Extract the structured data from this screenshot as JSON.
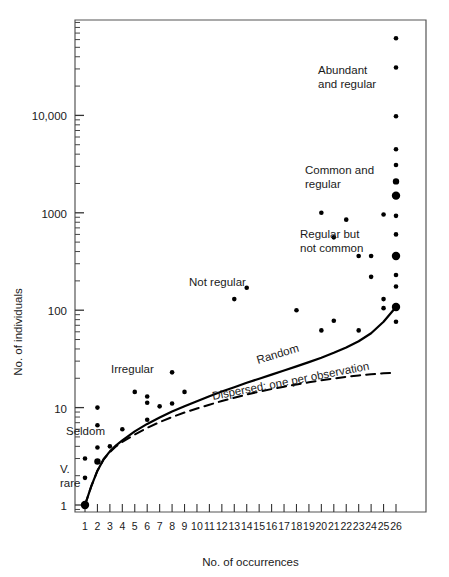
{
  "chart_data": {
    "type": "scatter",
    "title": "",
    "xlabel": "No. of occurrences",
    "ylabel": "No. of individuals",
    "xscale": "linear",
    "yscale": "log",
    "xlim": [
      0.2,
      26.9
    ],
    "ylim": [
      0.62,
      70000
    ],
    "grid": false,
    "legend": "none",
    "xticks": [
      1,
      2,
      3,
      4,
      5,
      6,
      7,
      8,
      9,
      10,
      11,
      12,
      13,
      14,
      15,
      16,
      17,
      18,
      19,
      20,
      21,
      22,
      23,
      24,
      25,
      26
    ],
    "xticklabels": [
      "1",
      "2",
      "3",
      "4",
      "5",
      "6",
      "7",
      "8",
      "9",
      "10",
      "11",
      "12",
      "13",
      "14",
      "15",
      "16",
      "17",
      "18",
      "19",
      "20",
      "21",
      "22",
      "23",
      "24",
      "25",
      "26"
    ],
    "yticks": [
      1,
      10,
      100,
      1000,
      10000
    ],
    "yticklabels": [
      "1",
      "10",
      "100",
      "1000",
      "10,000"
    ],
    "y_minor_ticks": true,
    "series": [
      {
        "name": "observations",
        "marker": "filled-circle",
        "color": "#000000",
        "points": [
          {
            "x": 1,
            "y": 1,
            "size": "large"
          },
          {
            "x": 1,
            "y": 1.9,
            "size": "small"
          },
          {
            "x": 1,
            "y": 3.0,
            "size": "small"
          },
          {
            "x": 2,
            "y": 2.8,
            "size": "medium"
          },
          {
            "x": 2,
            "y": 3.9,
            "size": "small"
          },
          {
            "x": 2,
            "y": 6.6,
            "size": "small"
          },
          {
            "x": 2,
            "y": 10.0,
            "size": "small"
          },
          {
            "x": 3,
            "y": 4.0,
            "size": "small"
          },
          {
            "x": 4,
            "y": 6.0,
            "size": "small"
          },
          {
            "x": 5,
            "y": 14.5,
            "size": "small"
          },
          {
            "x": 6,
            "y": 7.5,
            "size": "small"
          },
          {
            "x": 6,
            "y": 11.2,
            "size": "small"
          },
          {
            "x": 6,
            "y": 13.0,
            "size": "small"
          },
          {
            "x": 7,
            "y": 10.3,
            "size": "small"
          },
          {
            "x": 8,
            "y": 11.0,
            "size": "small"
          },
          {
            "x": 8,
            "y": 23.0,
            "size": "small"
          },
          {
            "x": 9,
            "y": 14.5,
            "size": "small"
          },
          {
            "x": 13,
            "y": 130.0,
            "size": "small"
          },
          {
            "x": 14,
            "y": 170.0,
            "size": "small"
          },
          {
            "x": 18,
            "y": 100.0,
            "size": "small"
          },
          {
            "x": 20,
            "y": 62.0,
            "size": "small"
          },
          {
            "x": 20,
            "y": 1000.0,
            "size": "small"
          },
          {
            "x": 21,
            "y": 78.0,
            "size": "small"
          },
          {
            "x": 21,
            "y": 560.0,
            "size": "small"
          },
          {
            "x": 22,
            "y": 850.0,
            "size": "small"
          },
          {
            "x": 23,
            "y": 62.0,
            "size": "small"
          },
          {
            "x": 23,
            "y": 360.0,
            "size": "small"
          },
          {
            "x": 24,
            "y": 220.0,
            "size": "small"
          },
          {
            "x": 24,
            "y": 360.0,
            "size": "small"
          },
          {
            "x": 25,
            "y": 105.0,
            "size": "small"
          },
          {
            "x": 25,
            "y": 130.0,
            "size": "small"
          },
          {
            "x": 25,
            "y": 960.0,
            "size": "small"
          },
          {
            "x": 26,
            "y": 76.0,
            "size": "small"
          },
          {
            "x": 26,
            "y": 108.0,
            "size": "large"
          },
          {
            "x": 26,
            "y": 175.0,
            "size": "small"
          },
          {
            "x": 26,
            "y": 230.0,
            "size": "small"
          },
          {
            "x": 26,
            "y": 360.0,
            "size": "large"
          },
          {
            "x": 26,
            "y": 600.0,
            "size": "small"
          },
          {
            "x": 26,
            "y": 930.0,
            "size": "small"
          },
          {
            "x": 26,
            "y": 1500.0,
            "size": "large"
          },
          {
            "x": 26,
            "y": 2100.0,
            "size": "medium"
          },
          {
            "x": 26,
            "y": 3100.0,
            "size": "small"
          },
          {
            "x": 26,
            "y": 4500.0,
            "size": "small"
          },
          {
            "x": 26,
            "y": 9800.0,
            "size": "small"
          },
          {
            "x": 26,
            "y": 31000.0,
            "size": "small"
          },
          {
            "x": 26,
            "y": 62000.0,
            "size": "small"
          }
        ]
      }
    ],
    "curves": [
      {
        "name": "Random",
        "style": "solid",
        "label": "Random",
        "points": [
          {
            "x": 1,
            "y": 1.0
          },
          {
            "x": 1.5,
            "y": 1.55
          },
          {
            "x": 2,
            "y": 2.25
          },
          {
            "x": 2.5,
            "y": 2.95
          },
          {
            "x": 3,
            "y": 3.55
          },
          {
            "x": 3.5,
            "y": 4.1
          },
          {
            "x": 4,
            "y": 4.6
          },
          {
            "x": 5,
            "y": 5.7
          },
          {
            "x": 6,
            "y": 6.8
          },
          {
            "x": 7,
            "y": 7.9
          },
          {
            "x": 8,
            "y": 9.1
          },
          {
            "x": 9,
            "y": 10.3
          },
          {
            "x": 10,
            "y": 11.6
          },
          {
            "x": 11,
            "y": 13.1
          },
          {
            "x": 12,
            "y": 14.6
          },
          {
            "x": 13,
            "y": 16.2
          },
          {
            "x": 14,
            "y": 18.0
          },
          {
            "x": 15,
            "y": 19.8
          },
          {
            "x": 16,
            "y": 21.8
          },
          {
            "x": 17,
            "y": 24.0
          },
          {
            "x": 18,
            "y": 26.5
          },
          {
            "x": 19,
            "y": 29.3
          },
          {
            "x": 20,
            "y": 32.5
          },
          {
            "x": 21,
            "y": 36.5
          },
          {
            "x": 22,
            "y": 41.5
          },
          {
            "x": 23,
            "y": 48.0
          },
          {
            "x": 24,
            "y": 58.0
          },
          {
            "x": 25,
            "y": 76.0
          },
          {
            "x": 26,
            "y": 108.0
          }
        ]
      },
      {
        "name": "Dispersed; one per observation",
        "style": "dashed",
        "label": "Dispersed; one per observation",
        "points": [
          {
            "x": 1,
            "y": 1.0
          },
          {
            "x": 1.5,
            "y": 1.55
          },
          {
            "x": 2,
            "y": 2.25
          },
          {
            "x": 2.5,
            "y": 2.95
          },
          {
            "x": 3,
            "y": 3.5
          },
          {
            "x": 3.5,
            "y": 4.0
          },
          {
            "x": 4,
            "y": 4.45
          },
          {
            "x": 5,
            "y": 5.3
          },
          {
            "x": 6,
            "y": 6.2
          },
          {
            "x": 7,
            "y": 7.1
          },
          {
            "x": 8,
            "y": 8.0
          },
          {
            "x": 9,
            "y": 8.9
          },
          {
            "x": 10,
            "y": 9.8
          },
          {
            "x": 11,
            "y": 10.7
          },
          {
            "x": 12,
            "y": 11.7
          },
          {
            "x": 13,
            "y": 12.6
          },
          {
            "x": 14,
            "y": 13.6
          },
          {
            "x": 15,
            "y": 14.6
          },
          {
            "x": 16,
            "y": 15.5
          },
          {
            "x": 17,
            "y": 16.4
          },
          {
            "x": 18,
            "y": 17.3
          },
          {
            "x": 19,
            "y": 18.2
          },
          {
            "x": 20,
            "y": 19.1
          },
          {
            "x": 21,
            "y": 19.9
          },
          {
            "x": 22,
            "y": 20.7
          },
          {
            "x": 23,
            "y": 21.4
          },
          {
            "x": 24,
            "y": 22.0
          },
          {
            "x": 25,
            "y": 22.5
          },
          {
            "x": 26,
            "y": 22.9
          }
        ]
      }
    ],
    "annotations": [
      {
        "id": "abundant-and-regular",
        "lines": [
          "Abundant",
          "and regular"
        ],
        "x_px": 318,
        "y_px": 74,
        "anchor": "start"
      },
      {
        "id": "common-and-regular",
        "lines": [
          "Common and",
          "regular"
        ],
        "x_px": 305,
        "y_px": 174,
        "anchor": "start"
      },
      {
        "id": "regular-but-not-common",
        "lines": [
          "Regular but",
          "not common"
        ],
        "x_px": 300,
        "y_px": 238,
        "anchor": "start"
      },
      {
        "id": "not-regular",
        "lines": [
          "Not regular"
        ],
        "x_px": 189,
        "y_px": 286,
        "anchor": "start"
      },
      {
        "id": "irregular",
        "lines": [
          "Irregular"
        ],
        "x_px": 111,
        "y_px": 373,
        "anchor": "start"
      },
      {
        "id": "seldom",
        "lines": [
          "Seldom"
        ],
        "x_px": 66,
        "y_px": 435,
        "anchor": "start"
      },
      {
        "id": "v-rare",
        "lines": [
          "V.",
          "rare"
        ],
        "x_px": 60,
        "y_px": 473,
        "anchor": "start"
      },
      {
        "id": "random-curve-label",
        "lines": [
          "Random"
        ],
        "x_px": 258,
        "y_px": 364,
        "anchor": "start",
        "rotation": -17
      },
      {
        "id": "dispersed-curve-label",
        "lines": [
          "Dispersed; one per observation"
        ],
        "x_px": 213,
        "y_px": 400,
        "anchor": "start",
        "rotation": -11
      }
    ],
    "colors": {
      "marker": "#000000",
      "axis": "#555555",
      "curve": "#000000",
      "text": "#1a1a1a",
      "background": "#ffffff"
    }
  }
}
